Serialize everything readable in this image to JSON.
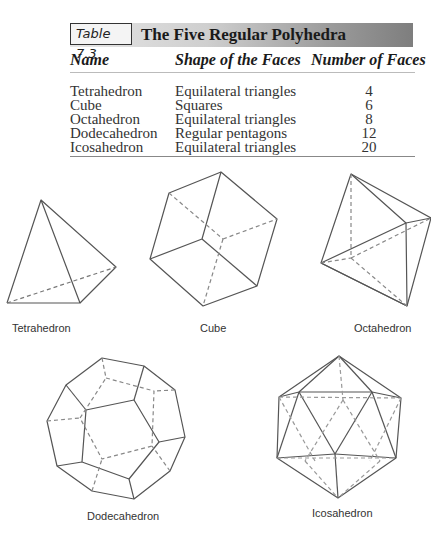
{
  "table": {
    "tag": "Table 7.3",
    "title": "The Five Regular Polyhedra",
    "headers": [
      "Name",
      "Shape of the Faces",
      "Number of Faces"
    ],
    "rows": [
      {
        "name": "Tetrahedron",
        "shape": "Equilateral triangles",
        "faces": "4"
      },
      {
        "name": "Cube",
        "shape": "Squares",
        "faces": "6"
      },
      {
        "name": "Octahedron",
        "shape": "Equilateral triangles",
        "faces": "8"
      },
      {
        "name": "Dodecahedron",
        "shape": "Regular pentagons",
        "faces": "12"
      },
      {
        "name": "Icosahedron",
        "shape": "Equilateral triangles",
        "faces": "20"
      }
    ]
  },
  "figures": {
    "captions": [
      "Tetrahedron",
      "Cube",
      "Octahedron",
      "Dodecahedron",
      "Icosahedron"
    ]
  },
  "colors": {
    "line": "#555555",
    "header_gradient_start": "#e6e6e6",
    "header_gradient_end": "#7e7e7e"
  }
}
